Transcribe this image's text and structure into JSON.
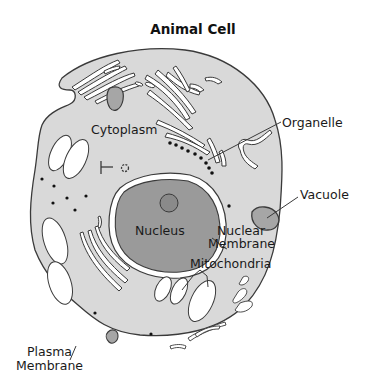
{
  "diagram": {
    "title": "Animal Cell",
    "labels": {
      "cytoplasm": "Cytoplasm",
      "organelle": "Organelle",
      "vacuole": "Vacuole",
      "nucleus": "Nucleus",
      "nuclear_membrane_line1": "Nuclear",
      "nuclear_membrane_line2": "Membrane",
      "mitochondria": "Mitochondria",
      "plasma_membrane_line1": "Plasma",
      "plasma_membrane_line2": "Membrane"
    },
    "colors": {
      "cytoplasm_fill": "#d9d9d9",
      "nucleus_fill": "#9a9a9a",
      "vacuole_fill": "#a6a6a6",
      "outline": "#3a3a3a",
      "background": "#ffffff"
    }
  }
}
